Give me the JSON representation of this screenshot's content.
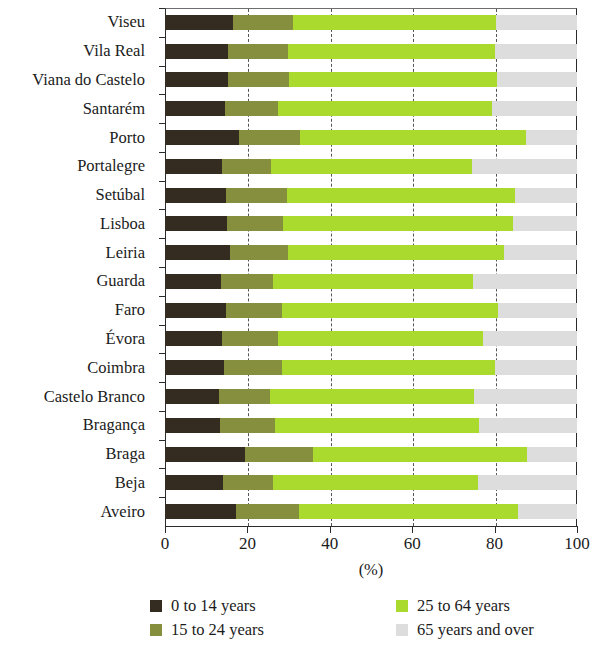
{
  "chart_data": {
    "type": "bar",
    "subtype": "stacked-horizontal-100",
    "title": "",
    "xlabel": "(%)",
    "ylabel": "",
    "xlim": [
      0,
      100
    ],
    "xticks": [
      0,
      20,
      40,
      60,
      80,
      100
    ],
    "xticklabels": [
      "0",
      "20",
      "40",
      "60",
      "80",
      "100"
    ],
    "grid": "vertical-dashed",
    "legend_position": "bottom",
    "categories": [
      "Viseu",
      "Vila Real",
      "Viana do Castelo",
      "Santarém",
      "Porto",
      "Portalegre",
      "Setúbal",
      "Lisboa",
      "Leiria",
      "Guarda",
      "Faro",
      "Évora",
      "Coimbra",
      "Castelo Branco",
      "Bragança",
      "Braga",
      "Beja",
      "Aveiro"
    ],
    "series": [
      {
        "name": "0 to 14 years",
        "color": "#352c21",
        "values": [
          16.4,
          15.2,
          15.4,
          14.6,
          18.0,
          13.8,
          14.7,
          15.0,
          15.8,
          13.5,
          14.8,
          13.8,
          14.2,
          13.2,
          13.3,
          19.4,
          14.0,
          17.2
        ]
      },
      {
        "name": "15 to 24 years",
        "color": "#858f3e",
        "values": [
          14.7,
          14.7,
          14.8,
          12.9,
          14.8,
          11.9,
          15.0,
          13.6,
          14.1,
          12.8,
          13.5,
          13.7,
          14.1,
          12.3,
          13.4,
          16.6,
          12.1,
          15.4
        ]
      },
      {
        "name": "25 to 64 years",
        "color": "#aada2d",
        "values": [
          49.2,
          50.2,
          50.3,
          51.8,
          54.8,
          48.7,
          55.3,
          55.8,
          52.4,
          48.5,
          52.6,
          49.8,
          51.8,
          49.6,
          49.6,
          51.8,
          49.8,
          53.2
        ]
      },
      {
        "name": "65 years and over",
        "color": "#dddddd",
        "values": [
          19.7,
          19.9,
          19.5,
          20.7,
          12.4,
          25.6,
          15.0,
          15.6,
          17.7,
          25.2,
          19.1,
          22.7,
          19.9,
          24.9,
          23.7,
          12.2,
          24.1,
          14.2
        ]
      }
    ]
  },
  "axis": {
    "x_title": "(%)",
    "tick_labels": [
      "0",
      "20",
      "40",
      "60",
      "80",
      "100"
    ]
  },
  "legend": {
    "items": [
      {
        "label": "0 to 14 years",
        "color": "#352c21"
      },
      {
        "label": "15 to 24 years",
        "color": "#858f3e"
      },
      {
        "label": "25 to 64 years",
        "color": "#aada2d"
      },
      {
        "label": "65 years and over",
        "color": "#dddddd"
      }
    ]
  }
}
